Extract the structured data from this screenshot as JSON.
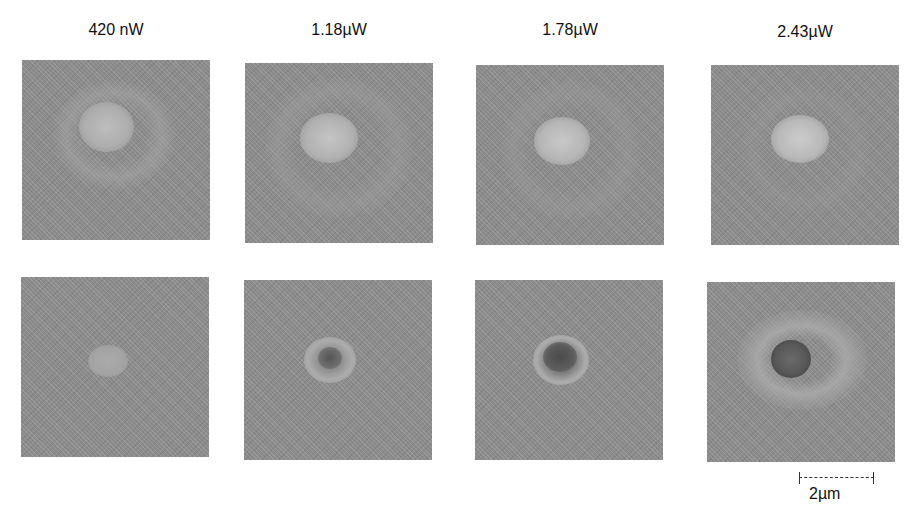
{
  "figure": {
    "columns": [
      {
        "label": "420 nW"
      },
      {
        "label": "1.18µW"
      },
      {
        "label": "1.78µW"
      },
      {
        "label": "2.43µW"
      }
    ],
    "rows": [
      {
        "description": "bright central spot with surrounding ring"
      },
      {
        "description": "dark/hatched central spot with light halo, growing with power"
      }
    ],
    "scale_bar": {
      "label": "2µm"
    }
  }
}
